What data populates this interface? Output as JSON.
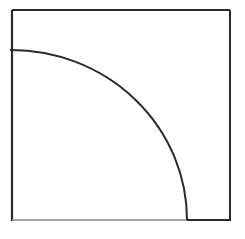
{
  "diagram": {
    "type": "square-with-quarter-arc",
    "background": "#ffffff",
    "square": {
      "x": 12,
      "y": 10,
      "width": 218,
      "height": 210,
      "stroke": "#2a2a2a",
      "stroke_width": 2
    },
    "bottom_left_segment": {
      "x1": 12,
      "y1": 220,
      "x2": 187,
      "y2": 220,
      "stroke": "#8a8a8a",
      "stroke_width": 1.5
    },
    "arc": {
      "start_x": 10,
      "start_y": 50,
      "end_x": 187,
      "end_y": 220,
      "rx": 175,
      "ry": 170,
      "stroke": "#2a2a2a",
      "stroke_width": 2
    }
  }
}
